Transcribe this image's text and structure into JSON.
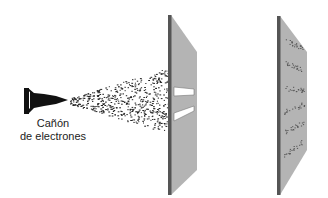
{
  "diagram": {
    "gun": {
      "label_line1": "Cañón",
      "label_line2": "de electrones"
    },
    "barrier": {
      "slits": 2
    },
    "screen": {
      "pattern": "interference bands",
      "bands": 6
    },
    "colors": {
      "plate_face": "#b4b4b4",
      "plate_edge": "#555555",
      "gun": "#111111",
      "particles": "#222222"
    }
  }
}
